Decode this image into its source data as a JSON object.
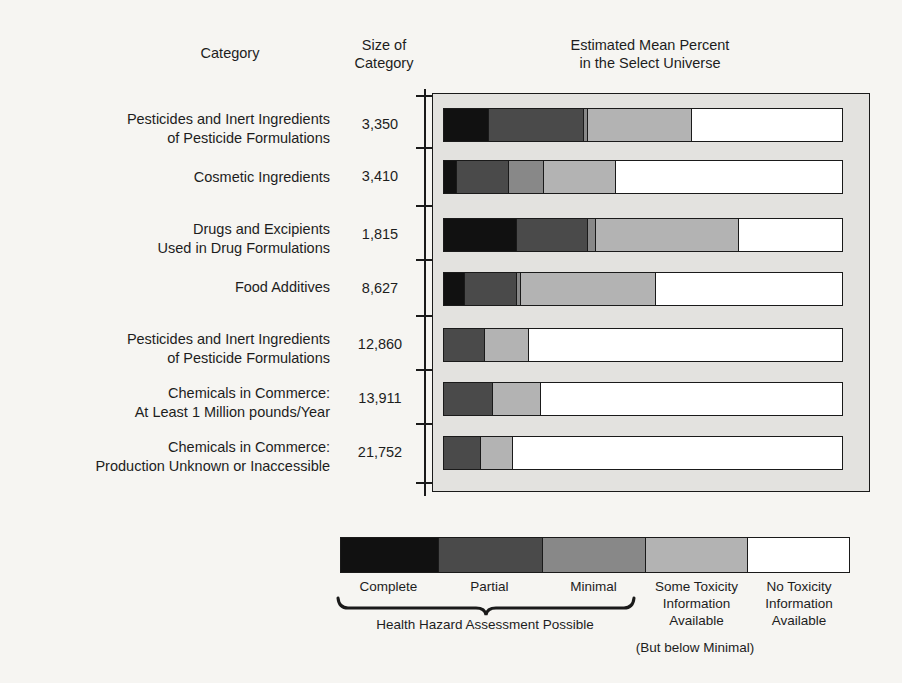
{
  "headers": {
    "category": "Category",
    "size_of_category": "Size of\nCategory",
    "estimated_mean": "Estimated Mean Percent\nin the Select Universe"
  },
  "chart_data": {
    "type": "bar",
    "orientation": "horizontal",
    "stacked": true,
    "title": "Estimated Mean Percent in the Select Universe",
    "xlabel": "",
    "ylabel": "Category",
    "xlim": [
      0,
      100
    ],
    "grid": false,
    "legend_position": "bottom",
    "categories": [
      "Pesticides and Inert Ingredients\nof Pesticide Formulations",
      "Cosmetic Ingredients",
      "Drugs and Excipients\nUsed in Drug Formulations",
      "Food Additives",
      "Pesticides and Inert Ingredients\nof Pesticide Formulations",
      "Chemicals in Commerce:\nAt Least 1 Million pounds/Year",
      "Chemicals in Commerce:\nProduction Unknown or Inaccessible"
    ],
    "category_sizes": [
      "3,350",
      "3,410",
      "1,815",
      "8,627",
      "12,860",
      "13,911",
      "21,752"
    ],
    "series": [
      {
        "name": "Complete",
        "color": "#111111",
        "values": [
          11,
          3,
          18,
          5,
          0,
          0,
          0
        ]
      },
      {
        "name": "Partial",
        "color": "#4a4a4a",
        "values": [
          24,
          13,
          18,
          13,
          10,
          12,
          9
        ]
      },
      {
        "name": "Minimal",
        "color": "#888888",
        "values": [
          1,
          9,
          2,
          1,
          0,
          0,
          0
        ]
      },
      {
        "name": "Some Toxicity Information Available",
        "color": "#b3b3b3",
        "values": [
          26,
          18,
          36,
          34,
          11,
          12,
          8
        ]
      },
      {
        "name": "No Toxicity Information Available",
        "color": "#ffffff",
        "values": [
          38,
          57,
          26,
          47,
          79,
          76,
          83
        ]
      }
    ]
  },
  "legend": {
    "swatches": [
      {
        "label": "Complete",
        "color": "#111111",
        "width_pct": 19
      },
      {
        "label": "Partial",
        "color": "#4a4a4a",
        "width_pct": 20.6
      },
      {
        "label": "Minimal",
        "color": "#888888",
        "width_pct": 20.2
      },
      {
        "label": "Some Toxicity\nInformation\nAvailable",
        "color": "#b3b3b3",
        "width_pct": 20.2
      },
      {
        "label": "No Toxicity\nInformation\nAvailable",
        "color": "#ffffff",
        "width_pct": 20.0
      }
    ],
    "brace_note": "Health Hazard Assessment Possible",
    "below_minimal": "(But below Minimal)"
  }
}
